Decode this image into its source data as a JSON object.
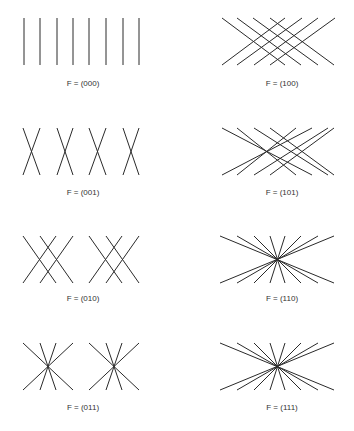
{
  "figure": {
    "stroke_color": "#2a2a2a",
    "background": "#ffffff",
    "panels": [
      {
        "id": "000",
        "label": "F = (000)",
        "label_pos": [
          83,
          86
        ],
        "lines": [
          [
            24,
            18,
            24,
            65
          ],
          [
            40,
            18,
            40,
            65
          ],
          [
            57,
            18,
            57,
            65
          ],
          [
            73,
            18,
            73,
            65
          ],
          [
            89,
            18,
            89,
            65
          ],
          [
            106,
            18,
            106,
            65
          ],
          [
            123,
            18,
            123,
            65
          ],
          [
            139,
            18,
            139,
            65
          ]
        ]
      },
      {
        "id": "100",
        "label": "F = (100)",
        "label_pos": [
          282,
          86
        ],
        "lines": [
          [
            222,
            18,
            285,
            65
          ],
          [
            237,
            18,
            301,
            65
          ],
          [
            253,
            18,
            318,
            65
          ],
          [
            270,
            18,
            334,
            65
          ],
          [
            222,
            65,
            285,
            18
          ],
          [
            237,
            65,
            302,
            18
          ],
          [
            254,
            65,
            318,
            18
          ],
          [
            270,
            65,
            335,
            18
          ]
        ]
      },
      {
        "id": "001",
        "label": "F = (001)",
        "label_pos": [
          83,
          195
        ],
        "lines": [
          [
            23,
            128,
            40,
            175
          ],
          [
            40,
            128,
            23,
            175
          ],
          [
            57,
            128,
            73,
            175
          ],
          [
            73,
            128,
            57,
            175
          ],
          [
            89,
            128,
            106,
            175
          ],
          [
            106,
            128,
            89,
            175
          ],
          [
            123,
            128,
            139,
            175
          ],
          [
            139,
            128,
            123,
            175
          ]
        ]
      },
      {
        "id": "101",
        "label": "F = (101)",
        "label_pos": [
          282,
          195
        ],
        "lines": [
          [
            222,
            128,
            312,
            175
          ],
          [
            237,
            128,
            296,
            175
          ],
          [
            254,
            128,
            328,
            175
          ],
          [
            270,
            128,
            334,
            175
          ],
          [
            222,
            175,
            312,
            128
          ],
          [
            237,
            175,
            296,
            128
          ],
          [
            254,
            175,
            328,
            128
          ],
          [
            270,
            175,
            334,
            128
          ]
        ]
      },
      {
        "id": "010",
        "label": "F = (010)",
        "label_pos": [
          83,
          301
        ],
        "lines": [
          [
            23,
            236,
            56,
            283
          ],
          [
            40,
            236,
            73,
            283
          ],
          [
            56,
            236,
            23,
            283
          ],
          [
            73,
            236,
            40,
            283
          ],
          [
            89,
            236,
            122,
            283
          ],
          [
            106,
            236,
            139,
            283
          ],
          [
            122,
            236,
            89,
            283
          ],
          [
            139,
            236,
            106,
            283
          ]
        ]
      },
      {
        "id": "110",
        "label": "F = (110)",
        "label_pos": [
          282,
          301
        ],
        "lines": [
          [
            220,
            236,
            334,
            283
          ],
          [
            237,
            236,
            318,
            283
          ],
          [
            254,
            236,
            301,
            283
          ],
          [
            270,
            236,
            285,
            283
          ],
          [
            220,
            283,
            334,
            236
          ],
          [
            237,
            283,
            318,
            236
          ],
          [
            254,
            283,
            301,
            236
          ],
          [
            270,
            283,
            285,
            236
          ]
        ]
      },
      {
        "id": "011",
        "label": "F = (011)",
        "label_pos": [
          83,
          410
        ],
        "lines": [
          [
            23,
            343,
            73,
            390
          ],
          [
            40,
            343,
            56,
            390
          ],
          [
            56,
            343,
            40,
            390
          ],
          [
            73,
            343,
            23,
            390
          ],
          [
            89,
            343,
            139,
            390
          ],
          [
            106,
            343,
            122,
            390
          ],
          [
            122,
            343,
            106,
            390
          ],
          [
            139,
            343,
            89,
            390
          ]
        ]
      },
      {
        "id": "111",
        "label": "F = (111)",
        "label_pos": [
          282,
          410
        ],
        "lines": [
          [
            220,
            343,
            334,
            390
          ],
          [
            237,
            343,
            318,
            390
          ],
          [
            254,
            343,
            301,
            390
          ],
          [
            270,
            343,
            285,
            390
          ],
          [
            220,
            390,
            334,
            343
          ],
          [
            237,
            390,
            318,
            343
          ],
          [
            254,
            390,
            301,
            343
          ],
          [
            270,
            390,
            285,
            343
          ]
        ]
      }
    ]
  }
}
